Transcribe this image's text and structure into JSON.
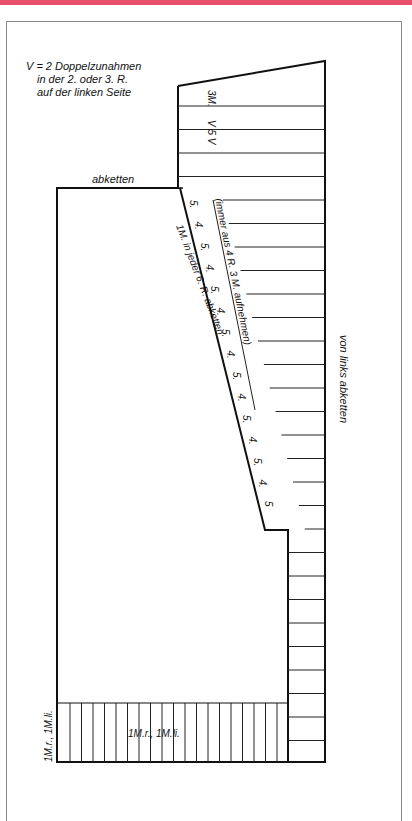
{
  "header_bar_color": "#e8506a",
  "diagram": {
    "title_note": {
      "line1": "V = 2 Doppelzunahmen",
      "line2": "in der 2. oder 3. R.",
      "line3": "auf der linken Seite"
    },
    "labels": {
      "cast_off_top": "abketten",
      "top_stitches": "3M.",
      "increase_marker": "V 5 V",
      "pickup_note": "(immer aus 4 R. 3 M. aufnehmen)",
      "decrease_note": "1M. in jeder 6. R. abketten",
      "right_side": "von links abketten",
      "rib_center": "1M.r., 1M.li.",
      "rib_side": "1M.r., 1M.li."
    },
    "slope_counts": [
      "5.",
      "4.",
      "5.",
      "4.",
      "5.",
      "4.",
      "5.",
      "4.",
      "5.",
      "4.",
      "5.",
      "4.",
      "5.",
      "4.",
      "5"
    ],
    "line_color": "#111111"
  }
}
